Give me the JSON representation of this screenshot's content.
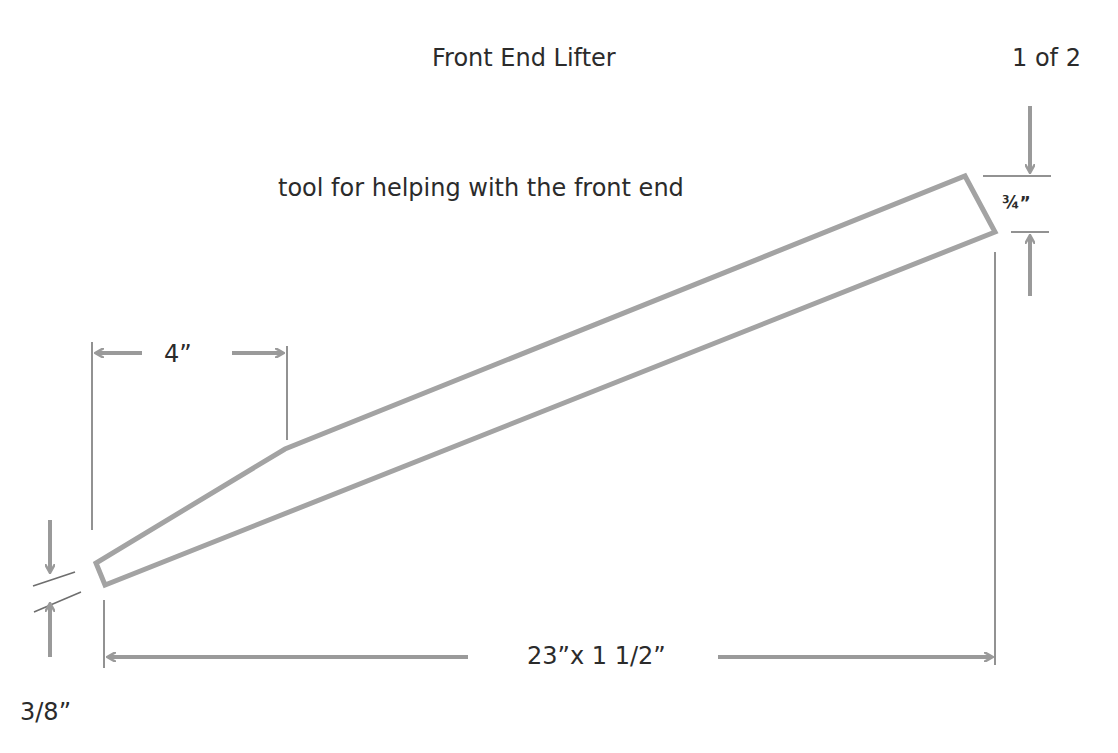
{
  "title": "Front End Lifter",
  "page_indicator": "1 of 2",
  "subtitle": "tool  for helping with the front end",
  "dimensions": {
    "end_height": "¾”",
    "taper_length": "4”",
    "overall": "23”x 1 1/2”",
    "tip_height": "3/8”"
  },
  "colors": {
    "shape_stroke": "#a3a3a3",
    "arrow": "#9a9a9a",
    "extension_line": "#6e6e6e",
    "text": "#2b2b2b",
    "background": "#ffffff"
  },
  "shape": {
    "name": "lifter-profile",
    "points": [
      [
        96,
        563
      ],
      [
        105,
        585
      ],
      [
        995,
        232
      ],
      [
        965,
        176
      ],
      [
        285,
        449
      ]
    ]
  }
}
